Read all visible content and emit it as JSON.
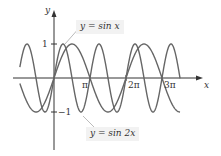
{
  "chart_data": {
    "type": "line",
    "title": "",
    "xlabel": "x",
    "ylabel": "y",
    "x_ticks": [
      "π",
      "2π",
      "3π"
    ],
    "x_tick_values": [
      3.1416,
      6.2832,
      9.4248
    ],
    "y_ticks": [
      "1",
      "-1"
    ],
    "y_tick_values": [
      1,
      -1
    ],
    "xlim": [
      -3.0,
      11.0
    ],
    "ylim": [
      -1.5,
      1.5
    ],
    "grid": false,
    "series": [
      {
        "name": "y = sin x",
        "function": "sin(x)",
        "x_range": [
          -2.98,
          11.0
        ]
      },
      {
        "name": "y = sin 2x",
        "function": "sin(2x)",
        "x_range": [
          -2.98,
          11.0
        ]
      }
    ],
    "annotations": [
      {
        "text": "y = sin x",
        "points_to": "sin x curve near x≈π/2"
      },
      {
        "text": "y = sin 2x",
        "points_to": "sin 2x curve near x≈3π/4"
      }
    ]
  },
  "labels": {
    "y_axis": "y",
    "x_axis": "x",
    "tick_1": "1",
    "tick_neg1": "−1",
    "tick_pi": "π",
    "tick_2pi": "2π",
    "tick_3pi": "3π",
    "callout_sinx": "y = sin x",
    "callout_sin2x": "y = sin 2x"
  },
  "colors": {
    "curve": "#666666",
    "axis": "#333333",
    "callout_bg": "#f2f2f2"
  }
}
